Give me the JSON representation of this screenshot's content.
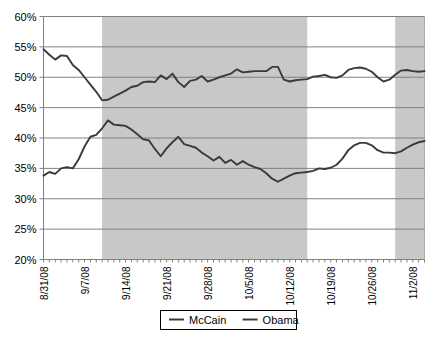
{
  "chart_data": {
    "type": "line",
    "title": "",
    "subtitle": "",
    "xlabel": "",
    "ylabel": "",
    "ylim": [
      20,
      60
    ],
    "ytick_labels": [
      "60%",
      "55%",
      "50%",
      "45%",
      "40%",
      "35%",
      "30%",
      "25%",
      "20%"
    ],
    "ytick_values": [
      60,
      55,
      50,
      45,
      40,
      35,
      30,
      25,
      20
    ],
    "grid": "horizontal",
    "legend_position": "bottom-center",
    "xtick_labels": [
      "8/31/08",
      "9/7/08",
      "9/14/08",
      "9/21/08",
      "9/28/08",
      "10/5/08",
      "10/12/08",
      "10/19/08",
      "10/26/08",
      "11/2/08"
    ],
    "x_start": "8/31/08",
    "x_end": "11/4/08",
    "n_points": 66,
    "shaded_bands": [
      {
        "start_index": 10,
        "end_index": 45,
        "color": "#c8c8c8"
      },
      {
        "start_index": 60,
        "end_index": 65,
        "color": "#c8c8c8"
      }
    ],
    "series": [
      {
        "name": "McCain",
        "color": "#3a3a3a",
        "values": [
          33.8,
          34.4,
          34.1,
          35.0,
          35.2,
          35.0,
          36.5,
          38.6,
          40.2,
          40.5,
          41.6,
          42.9,
          42.2,
          42.1,
          42.0,
          41.4,
          40.6,
          39.8,
          39.6,
          38.2,
          37.0,
          38.3,
          39.3,
          40.2,
          39.0,
          38.7,
          38.4,
          37.6,
          37.0,
          36.3,
          36.9,
          35.9,
          36.4,
          35.6,
          36.2,
          35.6,
          35.2,
          34.9,
          34.2,
          33.3,
          32.8,
          33.3,
          33.8,
          34.2,
          34.3,
          34.4,
          34.6,
          35.0,
          34.9,
          35.1,
          35.6,
          36.6,
          38.0,
          38.8,
          39.2,
          39.2,
          38.8,
          38.0,
          37.6,
          37.6,
          37.5,
          37.8,
          38.4,
          38.9,
          39.3,
          39.5
        ]
      },
      {
        "name": "Obama",
        "color": "#3a3a3a",
        "values": [
          54.6,
          53.7,
          52.9,
          53.6,
          53.5,
          52.0,
          51.2,
          50.0,
          48.8,
          47.6,
          46.2,
          46.3,
          46.8,
          47.3,
          47.8,
          48.4,
          48.6,
          49.2,
          49.3,
          49.2,
          50.3,
          49.7,
          50.6,
          49.2,
          48.4,
          49.4,
          49.6,
          50.2,
          49.3,
          49.6,
          50.0,
          50.3,
          50.6,
          51.3,
          50.8,
          50.9,
          51.0,
          51.0,
          51.0,
          51.7,
          51.7,
          49.6,
          49.3,
          49.5,
          49.6,
          49.7,
          50.1,
          50.2,
          50.4,
          50.0,
          49.9,
          50.3,
          51.2,
          51.5,
          51.6,
          51.4,
          50.9,
          50.0,
          49.3,
          49.6,
          50.4,
          51.1,
          51.2,
          51.0,
          50.9,
          51.0
        ]
      }
    ],
    "legend": [
      {
        "label": "McCain",
        "color": "#3a3a3a"
      },
      {
        "label": "Obama",
        "color": "#3a3a3a"
      }
    ]
  },
  "colors": {
    "line": "#3a3a3a",
    "grid": "#808080",
    "axis": "#808080",
    "shade": "#c8c8c8",
    "background": "#ffffff",
    "text": "#000000"
  }
}
